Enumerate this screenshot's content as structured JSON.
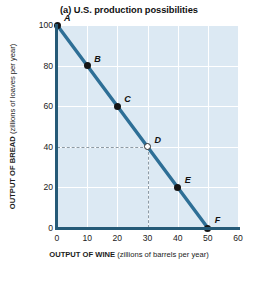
{
  "chart_data": {
    "type": "line",
    "title": "(a) U.S. production possibilities",
    "xlabel_bold": "OUTPUT OF WINE",
    "xlabel_rest": "(zillions of barrels per year)",
    "ylabel_bold": "OUTPUT OF BREAD",
    "ylabel_rest": "(zillions of loaves per year)",
    "xlim": [
      0,
      60
    ],
    "ylim": [
      0,
      100
    ],
    "xticks": [
      0,
      10,
      20,
      30,
      40,
      50,
      60
    ],
    "yticks": [
      0,
      20,
      40,
      60,
      80,
      100
    ],
    "grid": true,
    "legend": "none",
    "series": [
      {
        "name": "U.S. production possibility frontier",
        "x": [
          0,
          50
        ],
        "y": [
          100,
          0
        ],
        "color": "#2e6f96"
      }
    ],
    "points": [
      {
        "label": "A",
        "x": 0,
        "y": 100,
        "marker": "filled",
        "label_dx": 7,
        "label_dy": -12
      },
      {
        "label": "B",
        "x": 10,
        "y": 80,
        "marker": "filled",
        "label_dx": 7,
        "label_dy": -12
      },
      {
        "label": "C",
        "x": 20,
        "y": 60,
        "marker": "filled",
        "label_dx": 7,
        "label_dy": -12
      },
      {
        "label": "D",
        "x": 30,
        "y": 40,
        "marker": "open",
        "label_dx": 7,
        "label_dy": -12
      },
      {
        "label": "E",
        "x": 40,
        "y": 20,
        "marker": "filled",
        "label_dx": 7,
        "label_dy": -12
      },
      {
        "label": "F",
        "x": 50,
        "y": 0,
        "marker": "filled",
        "label_dx": 7,
        "label_dy": -13
      }
    ],
    "guides": [
      {
        "from": [
          0,
          40
        ],
        "to": [
          30,
          40
        ],
        "style": "dashed"
      },
      {
        "from": [
          30,
          0
        ],
        "to": [
          30,
          40
        ],
        "style": "dashed"
      }
    ],
    "colors": {
      "plot_background": "#dce9f3",
      "gridlines": "#ffffff",
      "axis": "#255a77",
      "line": "#2e6f96",
      "marker": "#151515",
      "guide": "#8d9aa4"
    }
  }
}
